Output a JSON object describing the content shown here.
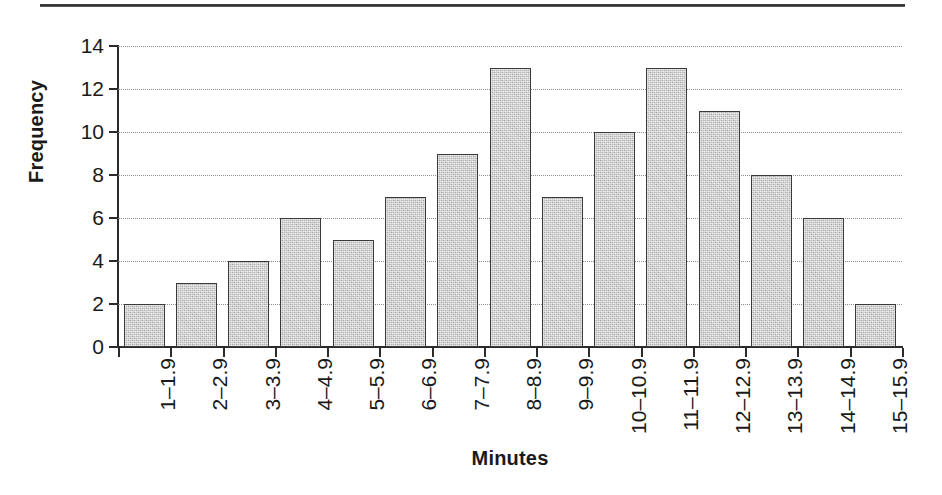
{
  "figure": {
    "top_rule": "horizontal-rule",
    "background_color": "#ffffff",
    "bar_fill_color": "#b9b9b9",
    "bar_border_color": "#3a3a3a",
    "gridline_color": "#8d8d8d",
    "text_color": "#1a1a1a"
  },
  "chart_data": {
    "type": "bar",
    "title": "",
    "subtitle": "",
    "xlabel": "Minutes",
    "ylabel": "Frequency",
    "categories": [
      "1–1.9",
      "2–2.9",
      "3–3.9",
      "4–4.9",
      "5–5.9",
      "6–6.9",
      "7–7.9",
      "8–8.9",
      "9–9.9",
      "10–10.9",
      "11–11.9",
      "12–12.9",
      "13–13.9",
      "14–14.9",
      "15–15.9"
    ],
    "values": [
      2,
      3,
      4,
      6,
      5,
      7,
      9,
      13,
      7,
      10,
      13,
      11,
      8,
      6,
      2
    ],
    "ylim": [
      0,
      14
    ],
    "yticks": [
      0,
      2,
      4,
      6,
      8,
      10,
      12,
      14
    ],
    "ytick_labels": [
      "0",
      "2",
      "4",
      "6",
      "8",
      "10",
      "12",
      "14"
    ],
    "grid": "horizontal-dotted",
    "legend": "none",
    "annotations": []
  }
}
